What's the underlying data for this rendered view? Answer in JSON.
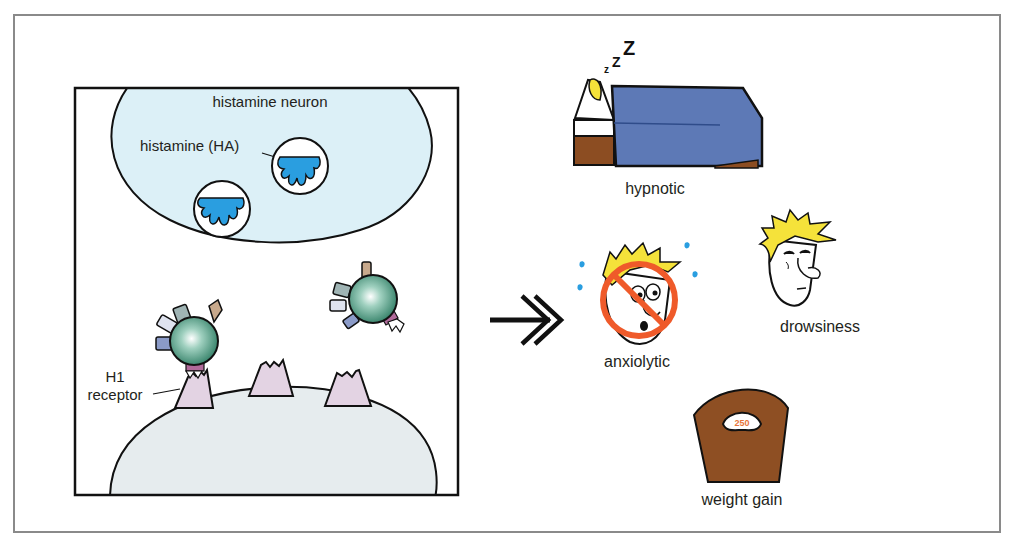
{
  "figure": {
    "type": "pharmacology-schematic",
    "left_panel": {
      "neuron_label": "histamine neuron",
      "histamine_label": "histamine (HA)",
      "receptor_label_line1": "H1",
      "receptor_label_line2": "receptor"
    },
    "arrow": "leads-to",
    "effects": [
      {
        "id": "hypnotic",
        "label": "hypnotic",
        "icon": "sleeping-in-bed-icon"
      },
      {
        "id": "anxiolytic",
        "label": "anxiolytic",
        "icon": "no-anxiety-face-icon"
      },
      {
        "id": "drowsiness",
        "label": "drowsiness",
        "icon": "drowsy-face-icon"
      },
      {
        "id": "weight-gain",
        "label": "weight gain",
        "icon": "bathroom-scale-icon"
      }
    ],
    "sleep_letters": [
      "z",
      "Z",
      "Z"
    ],
    "scale_reading": "250"
  },
  "colors": {
    "frame": "#8a8a8a",
    "neuron_fill": "#dcf0f7",
    "postsynaptic_fill": "#e6ecee",
    "histamine_blue": "#2a9ee0",
    "receptor_fill": "#e3d3e3",
    "drug_green": "#3f9a7a",
    "blanket": "#5d79b6",
    "bed_wood": "#8c4d22",
    "hair": "#f5e23a",
    "prohibit_orange": "#ef5a2a",
    "scale_brown": "#8e4f23",
    "scale_number": "#e7753a"
  }
}
